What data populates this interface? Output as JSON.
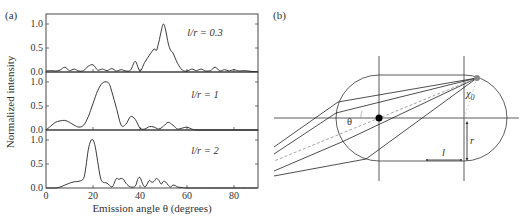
{
  "panel_a": {
    "label": "(a)",
    "ylabel": "Normalized intensity",
    "xlabel": "Emission angle θ (degrees)",
    "xticks": [
      "0",
      "20",
      "40",
      "60",
      "80"
    ],
    "yticks": [
      "0.0",
      "0.5",
      "1.0"
    ]
  },
  "panel_b": {
    "label": "(b)",
    "theta_label": "θ",
    "chi_label": "χ",
    "chi_sub": "0",
    "r_label": "r",
    "l_label": "l"
  },
  "chart_data": [
    {
      "type": "line",
      "title": "l/r = 0.3",
      "annotation": "l/r = 0.3",
      "xlabel": "Emission angle θ (degrees)",
      "ylabel": "Normalized intensity",
      "xlim": [
        0,
        90
      ],
      "ylim": [
        0,
        1.1
      ],
      "x": [
        0,
        2,
        4,
        6,
        8,
        10,
        12,
        14,
        16,
        18,
        20,
        22,
        24,
        26,
        28,
        30,
        32,
        34,
        36,
        38,
        40,
        42,
        44,
        46,
        47,
        48,
        49,
        50,
        51,
        52,
        53,
        54,
        56,
        58,
        60,
        62,
        64,
        66,
        68,
        70,
        72,
        74,
        76,
        78,
        80,
        82,
        84,
        86,
        88,
        90
      ],
      "values": [
        0.02,
        0.03,
        0.02,
        0.04,
        0.1,
        0.03,
        0.06,
        0.02,
        0.03,
        0.12,
        0.15,
        0.04,
        0.06,
        0.03,
        0.07,
        0.02,
        0.05,
        0.02,
        0.04,
        0.22,
        0.02,
        0.2,
        0.35,
        0.48,
        0.45,
        0.62,
        0.85,
        1.0,
        0.85,
        0.6,
        0.45,
        0.4,
        0.18,
        0.04,
        0.02,
        0.06,
        0.03,
        0.06,
        0.02,
        0.03,
        0.1,
        0.02,
        0.05,
        0.02,
        0.05,
        0.02,
        0.03,
        0.02,
        0.01,
        0.01
      ]
    },
    {
      "type": "line",
      "title": "l/r = 1",
      "annotation": "l/r = 1",
      "xlabel": "Emission angle θ (degrees)",
      "ylabel": "Normalized intensity",
      "xlim": [
        0,
        90
      ],
      "ylim": [
        0,
        1.1
      ],
      "x": [
        0,
        2,
        4,
        6,
        8,
        10,
        12,
        14,
        16,
        18,
        20,
        22,
        24,
        26,
        27,
        28,
        30,
        32,
        34,
        36,
        38,
        40,
        42,
        44,
        46,
        48,
        50,
        52,
        54,
        56,
        58,
        60,
        62,
        64,
        70,
        80,
        90
      ],
      "values": [
        0.0,
        0.08,
        0.16,
        0.19,
        0.2,
        0.16,
        0.1,
        0.06,
        0.1,
        0.28,
        0.55,
        0.82,
        0.98,
        1.0,
        0.95,
        0.8,
        0.45,
        0.1,
        0.12,
        0.28,
        0.22,
        0.04,
        0.02,
        0.07,
        0.06,
        0.02,
        0.08,
        0.16,
        0.1,
        0.02,
        0.04,
        0.06,
        0.02,
        0.0,
        0.0,
        0.0,
        0.0
      ]
    },
    {
      "type": "line",
      "title": "l/r = 2",
      "annotation": "l/r = 2",
      "xlabel": "Emission angle θ (degrees)",
      "ylabel": "Normalized intensity",
      "xlim": [
        0,
        90
      ],
      "ylim": [
        0,
        1.1
      ],
      "x": [
        0,
        4,
        6,
        8,
        10,
        12,
        14,
        16,
        17,
        18,
        19,
        20,
        21,
        22,
        23,
        24,
        26,
        28,
        29,
        30,
        31,
        32,
        33,
        34,
        36,
        38,
        39,
        40,
        41,
        42,
        43,
        44,
        45,
        46,
        47,
        48,
        49,
        50,
        51,
        52,
        53,
        54,
        55,
        56,
        58,
        60,
        70,
        80,
        90
      ],
      "values": [
        0.0,
        0.0,
        0.02,
        0.06,
        0.1,
        0.13,
        0.14,
        0.2,
        0.45,
        0.8,
        0.98,
        1.0,
        0.85,
        0.55,
        0.25,
        0.13,
        0.1,
        0.02,
        0.1,
        0.2,
        0.18,
        0.2,
        0.18,
        0.1,
        0.02,
        0.04,
        0.18,
        0.22,
        0.1,
        0.02,
        0.08,
        0.16,
        0.12,
        0.14,
        0.2,
        0.16,
        0.08,
        0.14,
        0.12,
        0.06,
        0.02,
        0.06,
        0.05,
        0.02,
        0.01,
        0.0,
        0.0,
        0.0,
        0.0
      ]
    }
  ]
}
